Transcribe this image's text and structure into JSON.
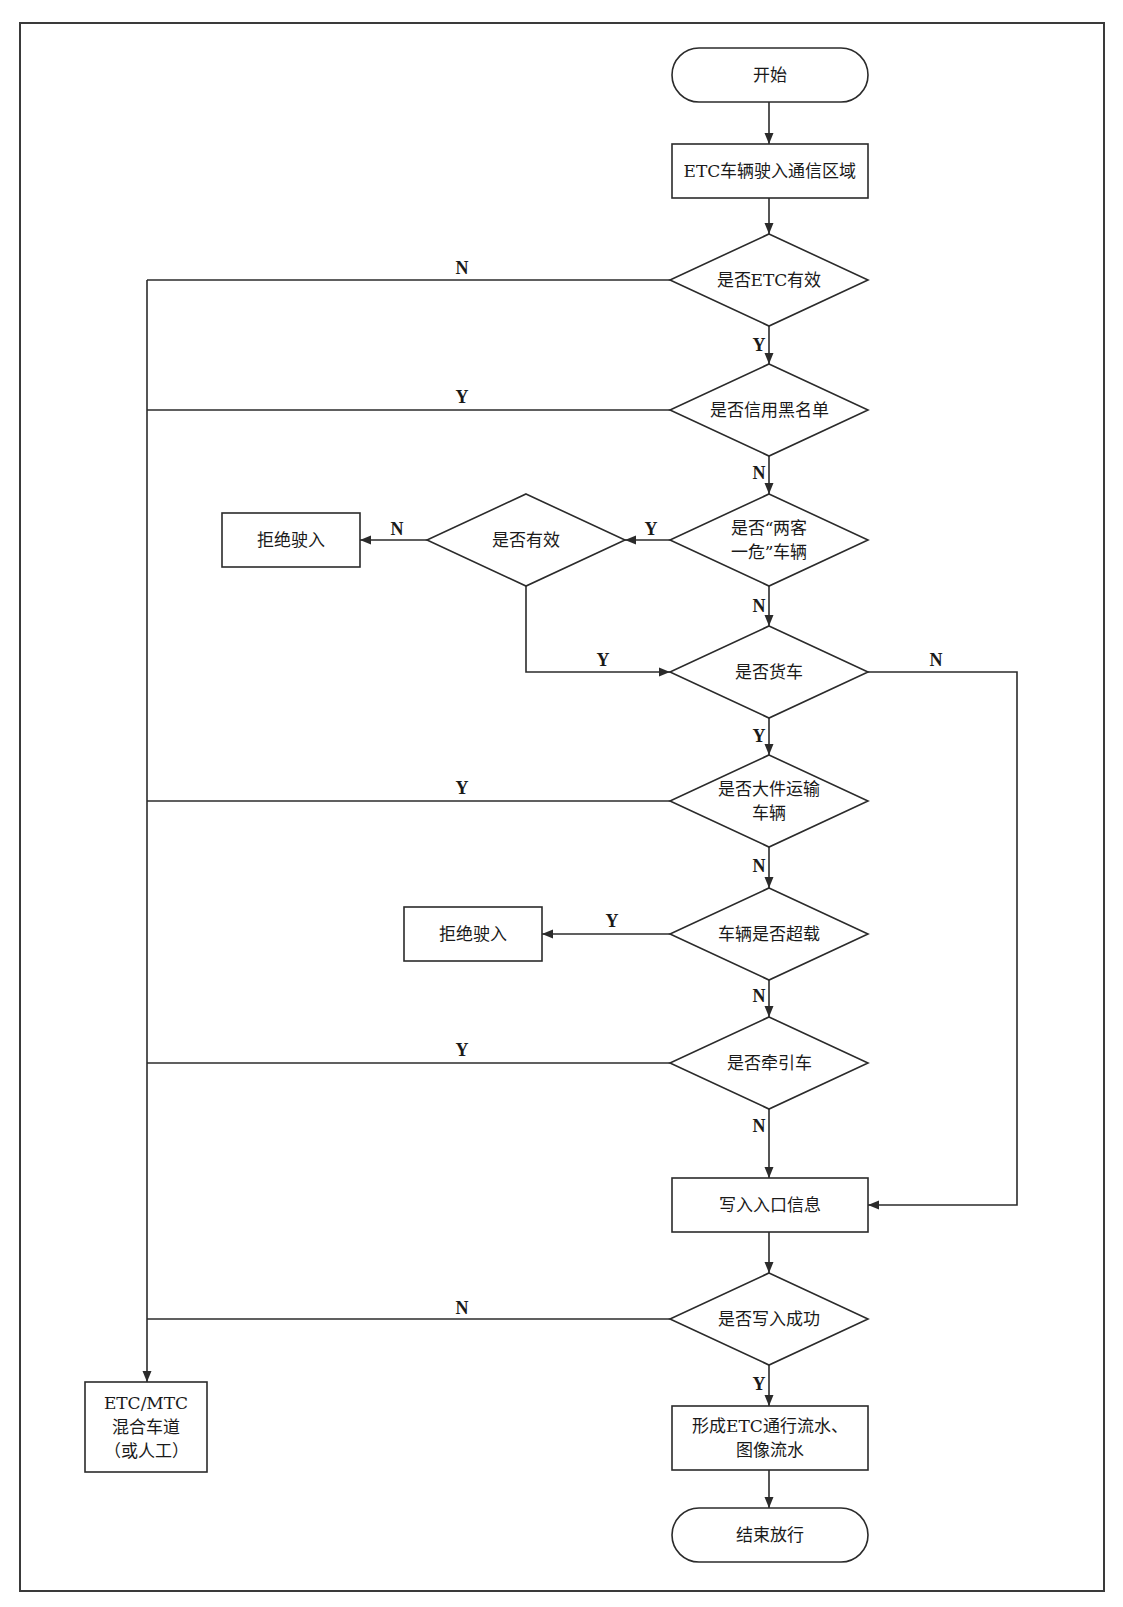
{
  "diagram": {
    "type": "flowchart",
    "frame": {
      "x": 20,
      "y": 23,
      "w": 1084,
      "h": 1568,
      "stroke": "#3a3a3a"
    },
    "colors": {
      "line": "#2b2b2b",
      "text": "#1a1a1a",
      "background": "#ffffff"
    },
    "nodes": [
      {
        "id": "start",
        "shape": "terminal",
        "x": 672,
        "y": 48,
        "w": 196,
        "h": 54,
        "lines": [
          "开始"
        ]
      },
      {
        "id": "enter_area",
        "shape": "process",
        "x": 672,
        "y": 144,
        "w": 196,
        "h": 54,
        "lines": [
          "ETC车辆驶入通信区域"
        ]
      },
      {
        "id": "etc_valid",
        "shape": "decision",
        "cx": 769,
        "cy": 280,
        "hw": 99,
        "hh": 46,
        "lines": [
          "是否ETC有效"
        ]
      },
      {
        "id": "credit_blacklist",
        "shape": "decision",
        "cx": 769,
        "cy": 410,
        "hw": 99,
        "hh": 46,
        "lines": [
          "是否信用黑名单"
        ]
      },
      {
        "id": "two_passenger_one_danger",
        "shape": "decision",
        "cx": 769,
        "cy": 540,
        "hw": 99,
        "hh": 46,
        "lines": [
          "是否“两客",
          "一危”车辆"
        ]
      },
      {
        "id": "is_valid",
        "shape": "decision",
        "cx": 526,
        "cy": 540,
        "hw": 99,
        "hh": 46,
        "lines": [
          "是否有效"
        ]
      },
      {
        "id": "reject_1",
        "shape": "process",
        "x": 222,
        "y": 513,
        "w": 138,
        "h": 54,
        "lines": [
          "拒绝驶入"
        ]
      },
      {
        "id": "is_truck",
        "shape": "decision",
        "cx": 769,
        "cy": 672,
        "hw": 99,
        "hh": 46,
        "lines": [
          "是否货车"
        ]
      },
      {
        "id": "oversize_transport",
        "shape": "decision",
        "cx": 769,
        "cy": 801,
        "hw": 99,
        "hh": 46,
        "lines": [
          "是否大件运输",
          "车辆"
        ]
      },
      {
        "id": "overloaded",
        "shape": "decision",
        "cx": 769,
        "cy": 934,
        "hw": 99,
        "hh": 46,
        "lines": [
          "车辆是否超载"
        ]
      },
      {
        "id": "reject_2",
        "shape": "process",
        "x": 404,
        "y": 907,
        "w": 138,
        "h": 54,
        "lines": [
          "拒绝驶入"
        ]
      },
      {
        "id": "tractor",
        "shape": "decision",
        "cx": 769,
        "cy": 1063,
        "hw": 99,
        "hh": 46,
        "lines": [
          "是否牵引车"
        ]
      },
      {
        "id": "write_entry",
        "shape": "process",
        "x": 672,
        "y": 1178,
        "w": 196,
        "h": 54,
        "lines": [
          "写入入口信息"
        ]
      },
      {
        "id": "write_success",
        "shape": "decision",
        "cx": 769,
        "cy": 1319,
        "hw": 99,
        "hh": 46,
        "lines": [
          "是否写入成功"
        ]
      },
      {
        "id": "mixed_lane",
        "shape": "process",
        "x": 85,
        "y": 1382,
        "w": 122,
        "h": 90,
        "lines": [
          "ETC/MTC",
          "混合车道",
          "（或人工）"
        ]
      },
      {
        "id": "form_record",
        "shape": "process",
        "x": 672,
        "y": 1406,
        "w": 196,
        "h": 64,
        "lines": [
          "形成ETC通行流水、",
          "图像流水"
        ]
      },
      {
        "id": "end",
        "shape": "terminal",
        "x": 672,
        "y": 1508,
        "w": 196,
        "h": 54,
        "lines": [
          "结束放行"
        ]
      }
    ],
    "edges": [
      {
        "from": "start",
        "to": "enter_area",
        "label": "",
        "points": [
          [
            769,
            102
          ],
          [
            769,
            144
          ]
        ]
      },
      {
        "from": "enter_area",
        "to": "etc_valid",
        "label": "",
        "points": [
          [
            769,
            198
          ],
          [
            769,
            234
          ]
        ]
      },
      {
        "from": "etc_valid",
        "to": "credit_blacklist",
        "label": "Y",
        "label_pos": [
          759,
          345
        ],
        "points": [
          [
            769,
            326
          ],
          [
            769,
            364
          ]
        ]
      },
      {
        "from": "etc_valid",
        "to": "mixed_lane",
        "label": "N",
        "label_pos": [
          462,
          268
        ],
        "points": [
          [
            670,
            280
          ],
          [
            147,
            280
          ]
        ]
      },
      {
        "from": "credit_blacklist",
        "to": "mixed_lane",
        "label": "Y",
        "label_pos": [
          462,
          397
        ],
        "points": [
          [
            670,
            410
          ],
          [
            147,
            410
          ]
        ]
      },
      {
        "from": "credit_blacklist",
        "to": "two_passenger_one_danger",
        "label": "N",
        "label_pos": [
          759,
          473
        ],
        "points": [
          [
            769,
            456
          ],
          [
            769,
            494
          ]
        ]
      },
      {
        "from": "two_passenger_one_danger",
        "to": "is_valid",
        "label": "Y",
        "label_pos": [
          651,
          529
        ],
        "points": [
          [
            670,
            540
          ],
          [
            625,
            540
          ]
        ]
      },
      {
        "from": "is_valid",
        "to": "reject_1",
        "label": "N",
        "label_pos": [
          397,
          529
        ],
        "points": [
          [
            427,
            540
          ],
          [
            360,
            540
          ]
        ]
      },
      {
        "from": "is_valid",
        "to": "is_truck",
        "label": "Y",
        "label_pos": [
          603,
          660
        ],
        "points": [
          [
            526,
            586
          ],
          [
            526,
            672
          ],
          [
            670,
            672
          ]
        ]
      },
      {
        "from": "two_passenger_one_danger",
        "to": "is_truck",
        "label": "N",
        "label_pos": [
          759,
          606
        ],
        "points": [
          [
            769,
            586
          ],
          [
            769,
            626
          ]
        ]
      },
      {
        "from": "is_truck",
        "to": "write_entry",
        "label": "N",
        "label_pos": [
          936,
          660
        ],
        "points": [
          [
            868,
            672
          ],
          [
            1017,
            672
          ],
          [
            1017,
            1205
          ],
          [
            868,
            1205
          ]
        ]
      },
      {
        "from": "is_truck",
        "to": "oversize_transport",
        "label": "Y",
        "label_pos": [
          759,
          736
        ],
        "points": [
          [
            769,
            718
          ],
          [
            769,
            755
          ]
        ]
      },
      {
        "from": "oversize_transport",
        "to": "mixed_lane",
        "label": "Y",
        "label_pos": [
          462,
          788
        ],
        "points": [
          [
            670,
            801
          ],
          [
            147,
            801
          ]
        ]
      },
      {
        "from": "oversize_transport",
        "to": "overloaded",
        "label": "N",
        "label_pos": [
          759,
          866
        ],
        "points": [
          [
            769,
            847
          ],
          [
            769,
            888
          ]
        ]
      },
      {
        "from": "overloaded",
        "to": "reject_2",
        "label": "Y",
        "label_pos": [
          612,
          921
        ],
        "points": [
          [
            670,
            934
          ],
          [
            542,
            934
          ]
        ]
      },
      {
        "from": "overloaded",
        "to": "tractor",
        "label": "N",
        "label_pos": [
          759,
          996
        ],
        "points": [
          [
            769,
            980
          ],
          [
            769,
            1017
          ]
        ]
      },
      {
        "from": "tractor",
        "to": "mixed_lane",
        "label": "Y",
        "label_pos": [
          462,
          1050
        ],
        "points": [
          [
            670,
            1063
          ],
          [
            147,
            1063
          ]
        ]
      },
      {
        "from": "tractor",
        "to": "write_entry",
        "label": "N",
        "label_pos": [
          759,
          1126
        ],
        "points": [
          [
            769,
            1109
          ],
          [
            769,
            1178
          ]
        ]
      },
      {
        "from": "write_entry",
        "to": "write_success",
        "label": "",
        "points": [
          [
            769,
            1232
          ],
          [
            769,
            1273
          ]
        ]
      },
      {
        "from": "write_success",
        "to": "mixed_lane",
        "label": "N",
        "label_pos": [
          462,
          1308
        ],
        "points": [
          [
            670,
            1319
          ],
          [
            147,
            1319
          ]
        ]
      },
      {
        "from": "write_success",
        "to": "form_record",
        "label": "Y",
        "label_pos": [
          759,
          1384
        ],
        "points": [
          [
            769,
            1365
          ],
          [
            769,
            1406
          ]
        ]
      },
      {
        "from": "form_record",
        "to": "end",
        "label": "",
        "points": [
          [
            769,
            1470
          ],
          [
            769,
            1508
          ]
        ]
      }
    ],
    "trunk": {
      "points": [
        [
          147,
          280
        ],
        [
          147,
          1382
        ]
      ],
      "arrow_at_end": true
    }
  }
}
